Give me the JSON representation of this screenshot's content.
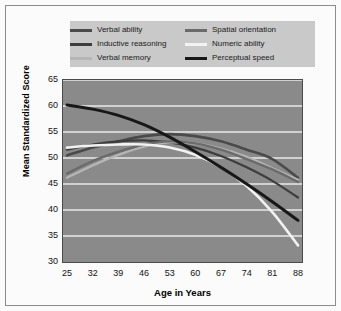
{
  "chart_data": {
    "type": "line",
    "title": "",
    "xlabel": "Age in Years",
    "ylabel": "Mean Standardized Score",
    "x": [
      25,
      32,
      39,
      46,
      53,
      60,
      67,
      74,
      81,
      88
    ],
    "xlim": [
      25,
      88
    ],
    "ylim": [
      30,
      65
    ],
    "xticks": [
      "25",
      "32",
      "39",
      "46",
      "53",
      "60",
      "67",
      "74",
      "81",
      "88"
    ],
    "yticks": [
      "30",
      "35",
      "40",
      "45",
      "50",
      "55",
      "60",
      "65"
    ],
    "grid": "horizontal",
    "legend_position": "top",
    "plot_background": "#8a8a8a",
    "gridline_color": "#e8e8e8",
    "series": [
      {
        "name": "Verbal ability",
        "color": "#4a4a4a",
        "width": 2.6,
        "values": [
          50.5,
          52.0,
          53.2,
          54.2,
          54.6,
          54.2,
          53.2,
          51.6,
          49.8,
          46.2
        ]
      },
      {
        "name": "Inductive reasoning",
        "color": "#3d3d3d",
        "width": 2.2,
        "values": [
          51.6,
          52.6,
          53.2,
          53.4,
          53.0,
          52.0,
          50.4,
          48.2,
          45.6,
          42.4
        ]
      },
      {
        "name": "Verbal memory",
        "color": "#b5b5b5",
        "width": 2.4,
        "values": [
          46.2,
          48.6,
          50.6,
          52.2,
          53.0,
          52.8,
          51.8,
          50.2,
          48.0,
          45.8
        ]
      },
      {
        "name": "Spatial orientation",
        "color": "#6b6b6b",
        "width": 2.4,
        "values": [
          47.0,
          49.4,
          51.2,
          52.6,
          53.2,
          52.8,
          51.6,
          49.8,
          47.8,
          45.4
        ]
      },
      {
        "name": "Numeric ability",
        "color": "#f2f2f2",
        "width": 2.6,
        "values": [
          52.0,
          52.4,
          52.6,
          52.6,
          52.0,
          50.6,
          48.2,
          44.6,
          39.6,
          33.2
        ]
      },
      {
        "name": "Perceptual speed",
        "color": "#181818",
        "width": 3.0,
        "values": [
          60.2,
          59.4,
          58.2,
          56.4,
          54.0,
          51.2,
          48.2,
          45.0,
          41.6,
          38.0
        ]
      }
    ]
  },
  "legend": {
    "items": [
      {
        "label": "Verbal ability",
        "swatch": "legend-swatch-verbal-ability"
      },
      {
        "label": "Spatial orientation",
        "swatch": "legend-swatch-spatial-orientation"
      },
      {
        "label": "Inductive reasoning",
        "swatch": "legend-swatch-inductive-reasoning"
      },
      {
        "label": "Numeric ability",
        "swatch": "legend-swatch-numeric-ability"
      },
      {
        "label": "Verbal memory",
        "swatch": "legend-swatch-verbal-memory"
      },
      {
        "label": "Perceptual speed",
        "swatch": "legend-swatch-perceptual-speed"
      }
    ]
  }
}
